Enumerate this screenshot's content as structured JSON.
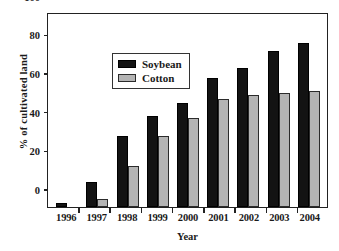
{
  "chart_data": {
    "type": "bar",
    "title": "",
    "xlabel": "Year",
    "ylabel": "% of cultivated land",
    "categories": [
      "1996",
      "1997",
      "1998",
      "1999",
      "2000",
      "2001",
      "2002",
      "2003",
      "2004"
    ],
    "series": [
      {
        "name": "Soybean",
        "color": "#131313",
        "values": [
          2,
          13,
          37,
          47,
          54,
          67,
          72,
          81,
          85
        ]
      },
      {
        "name": "Cotton",
        "color": "#b4b4b4",
        "values": [
          0,
          4,
          21,
          37,
          46,
          56,
          58,
          59,
          60
        ]
      }
    ],
    "ylim": [
      0,
      100
    ],
    "yticks": [
      0,
      20,
      40,
      60,
      80,
      100
    ],
    "ytick_labels": [
      "0",
      "20",
      "40",
      "60",
      "80",
      "100"
    ],
    "grid": false,
    "legend_position": "upper-left-inside"
  },
  "legend": {
    "entries": [
      {
        "label": "Soybean"
      },
      {
        "label": "Cotton"
      }
    ]
  }
}
